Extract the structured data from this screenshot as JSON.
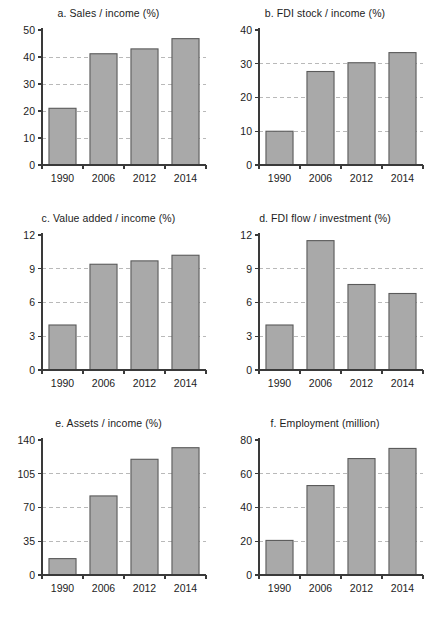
{
  "figure": {
    "background": "#ffffff",
    "bar_fill": "#a9a9a9",
    "bar_stroke": "#5a5a5a",
    "grid_color": "#b9b9b9",
    "axis_color": "#3a3a3a"
  },
  "chart_data": [
    {
      "type": "bar",
      "panel": "a",
      "title": "a. Sales / income (%)",
      "categories": [
        "1990",
        "2006",
        "2012",
        "2014"
      ],
      "values": [
        21,
        41.2,
        43,
        46.8
      ],
      "xlabel": "",
      "ylabel": "",
      "ylim": [
        0,
        50
      ],
      "yticks": [
        0,
        10,
        20,
        30,
        40,
        50
      ],
      "ytick_labels": [
        "0",
        "10",
        "20",
        "30",
        "40",
        "50"
      ],
      "grid": true,
      "legend": "none"
    },
    {
      "type": "bar",
      "panel": "b",
      "title": "b. FDI stock / income (%)",
      "categories": [
        "1990",
        "2006",
        "2012",
        "2014"
      ],
      "values": [
        10,
        27.7,
        30.3,
        33.3
      ],
      "xlabel": "",
      "ylabel": "",
      "ylim": [
        0,
        40
      ],
      "yticks": [
        0,
        10,
        20,
        30,
        40
      ],
      "ytick_labels": [
        "0",
        "10",
        "20",
        "30",
        "40"
      ],
      "grid": true,
      "legend": "none"
    },
    {
      "type": "bar",
      "panel": "c",
      "title": "c. Value added / income (%)",
      "categories": [
        "1990",
        "2006",
        "2012",
        "2014"
      ],
      "values": [
        4.0,
        9.4,
        9.7,
        10.2
      ],
      "xlabel": "",
      "ylabel": "",
      "ylim": [
        0,
        12
      ],
      "yticks": [
        0,
        3,
        6,
        9,
        12
      ],
      "ytick_labels": [
        "0",
        "3",
        "6",
        "9",
        "12"
      ],
      "grid": true,
      "legend": "none"
    },
    {
      "type": "bar",
      "panel": "d",
      "title": "d. FDI flow / investment (%)",
      "categories": [
        "1990",
        "2006",
        "2012",
        "2014"
      ],
      "values": [
        4.0,
        11.5,
        7.6,
        6.8
      ],
      "xlabel": "",
      "ylabel": "",
      "ylim": [
        0,
        12
      ],
      "yticks": [
        0,
        3,
        6,
        9,
        12
      ],
      "ytick_labels": [
        "0",
        "3",
        "6",
        "9",
        "12"
      ],
      "grid": true,
      "legend": "none"
    },
    {
      "type": "bar",
      "panel": "e",
      "title": "e. Assets / income (%)",
      "categories": [
        "1990",
        "2006",
        "2012",
        "2014"
      ],
      "values": [
        17,
        82,
        120,
        132
      ],
      "xlabel": "",
      "ylabel": "",
      "ylim": [
        0,
        140
      ],
      "yticks": [
        0,
        35,
        70,
        105,
        140
      ],
      "ytick_labels": [
        "0",
        "35",
        "70",
        "105",
        "140"
      ],
      "grid": true,
      "legend": "none"
    },
    {
      "type": "bar",
      "panel": "f",
      "title": "f. Employment (million)",
      "categories": [
        "1990",
        "2006",
        "2012",
        "2014"
      ],
      "values": [
        20.5,
        53,
        69,
        75
      ],
      "xlabel": "",
      "ylabel": "",
      "ylim": [
        0,
        80
      ],
      "yticks": [
        0,
        20,
        40,
        60,
        80
      ],
      "ytick_labels": [
        "0",
        "20",
        "40",
        "60",
        "80"
      ],
      "grid": true,
      "legend": "none"
    }
  ]
}
